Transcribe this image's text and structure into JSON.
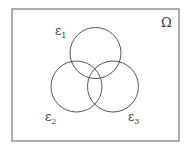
{
  "diagram": {
    "type": "venn",
    "universe": {
      "label": "Ω",
      "x": 12,
      "y": 9,
      "width": 167,
      "height": 132
    },
    "sets": [
      {
        "label": "ε",
        "subscript": "1",
        "cx": 95.5,
        "cy": 53,
        "r": 25.5,
        "label_x": 55,
        "label_y": 35
      },
      {
        "label": "ε",
        "subscript": "2",
        "cx": 76.5,
        "cy": 86.5,
        "r": 25.5,
        "label_x": 45,
        "label_y": 121
      },
      {
        "label": "ε",
        "subscript": "3",
        "cx": 113,
        "cy": 86.5,
        "r": 25.5,
        "label_x": 128,
        "label_y": 121
      }
    ],
    "stroke_color": "#555555",
    "background": "#ffffff"
  }
}
